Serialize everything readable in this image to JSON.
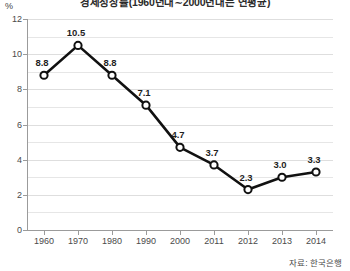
{
  "chart_data": {
    "type": "line",
    "title": "경제성장률(1960년대∼2000년대는 연평균)",
    "xlabel": "",
    "ylabel": "%",
    "unit_label": "%",
    "categories": [
      "1960",
      "1970",
      "1980",
      "1990",
      "2000",
      "2011",
      "2012",
      "2013",
      "2014"
    ],
    "values": [
      8.8,
      10.5,
      8.8,
      7.1,
      4.7,
      3.7,
      2.3,
      3.0,
      3.3
    ],
    "point_labels": [
      "8.8",
      "10.5",
      "8.8",
      "7.1",
      "4.7",
      "3.7",
      "2.3",
      "3.0",
      "3.3"
    ],
    "ylim": [
      0,
      12
    ],
    "ytick_labels": [
      "0",
      "2",
      "4",
      "6",
      "8",
      "10",
      "12"
    ],
    "ytick_values": [
      0,
      2,
      4,
      6,
      8,
      10,
      12
    ],
    "gridline_values": [
      0,
      1,
      2,
      3,
      4,
      5,
      6,
      7,
      8,
      9,
      10,
      11,
      12
    ],
    "grid": true,
    "legend": "none",
    "series_name": "경제성장률",
    "colors": {
      "line": "#111111",
      "marker_fill": "#ffffff",
      "marker_stroke": "#111111",
      "grid": "#e6e6e6",
      "axis": "#9b9b9b",
      "text": "#333333",
      "background": "#ffffff"
    }
  },
  "source": {
    "note": "자료: 한국은행"
  }
}
